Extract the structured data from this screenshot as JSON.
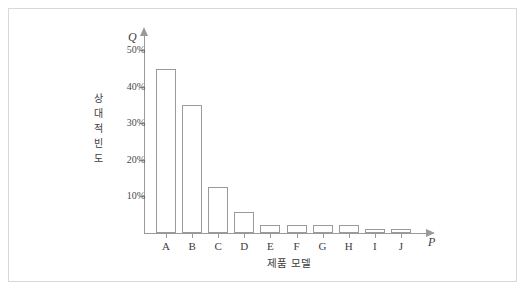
{
  "figure": {
    "border_color": "#d8d8d8",
    "background": "#ffffff",
    "bar_stroke": "#9a9a9a",
    "bar_fill": "#ffffff",
    "axis_color": "#9a9a9a",
    "text_color": "#3d3d3d"
  },
  "axis_vars": {
    "y": "Q",
    "x": "P"
  },
  "chart_data": {
    "type": "bar",
    "title": "",
    "xlabel": "제품 모델",
    "ylabel": "상대적 빈도",
    "ylabel_chars": [
      "상",
      "대",
      "적",
      "빈",
      "도"
    ],
    "categories": [
      "A",
      "B",
      "C",
      "D",
      "E",
      "F",
      "G",
      "H",
      "I",
      "J"
    ],
    "values": [
      45,
      35,
      12.5,
      5.7,
      2.2,
      2.2,
      2.2,
      2.2,
      1.2,
      1.2
    ],
    "value_labels": [
      "45%",
      "35%",
      "12.5%",
      "5.7%",
      "2.2%",
      "2.2%",
      "2.2%",
      "2.2%",
      "1.2%",
      "1.2%"
    ],
    "ylim": [
      0,
      55
    ],
    "yticks": [
      10,
      20,
      30,
      40,
      50
    ],
    "ytick_labels": [
      "10%",
      "20%",
      "30%",
      "40%",
      "50%"
    ],
    "grid": false,
    "legend": null,
    "legend_position": "none",
    "series": [
      {
        "name": "상대적 빈도",
        "values": [
          45,
          35,
          12.5,
          5.7,
          2.2,
          2.2,
          2.2,
          2.2,
          1.2,
          1.2
        ]
      }
    ]
  }
}
